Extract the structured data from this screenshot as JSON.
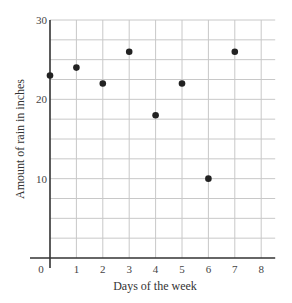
{
  "chart_data": {
    "type": "scatter",
    "title": "",
    "xlabel": "Days of the week",
    "ylabel": "Amount of rain in inches",
    "x": [
      0,
      1,
      2,
      3,
      4,
      5,
      6,
      7
    ],
    "values": [
      23,
      24,
      22,
      26,
      18,
      22,
      10,
      26
    ],
    "series": [
      {
        "name": "Rainfall",
        "x": [
          0,
          1,
          2,
          3,
          4,
          5,
          6,
          7
        ],
        "values": [
          23,
          24,
          22,
          26,
          18,
          22,
          10,
          26
        ]
      }
    ],
    "xlim": [
      0,
      8
    ],
    "ylim": [
      0,
      30
    ],
    "x_ticks": [
      "0",
      "1",
      "2",
      "3",
      "4",
      "5",
      "6",
      "7",
      "8"
    ],
    "y_ticks": [
      "10",
      "20",
      "30"
    ],
    "y_tick_values": [
      10,
      20,
      30
    ],
    "grid": true,
    "grid_y_step": 2.5,
    "legend": null,
    "point_color": "#222222"
  }
}
